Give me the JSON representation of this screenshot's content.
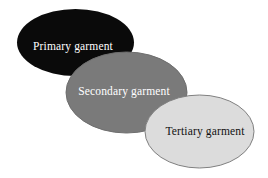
{
  "diagram": {
    "type": "layered-ellipse-cascade",
    "background_color": "#ffffff",
    "stages": [
      {
        "id": "primary",
        "label": "Primary garment",
        "fill": "#0a0a0a",
        "stroke": "none",
        "text_color": "#ffffff",
        "cx": 75.5,
        "cy": 42.5,
        "rx": 58.5,
        "ry": 33.5,
        "label_x": 73,
        "label_y": 47
      },
      {
        "id": "secondary",
        "label": "Secondary garment",
        "fill": "#7a7a7a",
        "stroke": "#6e6e6e",
        "text_color": "#ffffff",
        "cx": 126.5,
        "cy": 92.5,
        "rx": 60.5,
        "ry": 40.5,
        "label_x": 124,
        "label_y": 92
      },
      {
        "id": "tertiary",
        "label": "Tertiary garment",
        "fill": "#dcdcdc",
        "stroke": "#808080",
        "text_color": "#111111",
        "cx": 199.5,
        "cy": 131.5,
        "rx": 54.5,
        "ry": 36.5,
        "label_x": 205,
        "label_y": 132
      }
    ],
    "arrows": [
      {
        "id": "primary-to-secondary",
        "from": "primary",
        "to": "secondary",
        "color": "#111111",
        "x1": 84,
        "y1": 60,
        "x2": 118,
        "y2": 79,
        "style": "dotted"
      },
      {
        "id": "secondary-to-tertiary",
        "from": "secondary",
        "to": "tertiary",
        "color": "#b4b4b4",
        "x1": 159,
        "y1": 108,
        "x2": 192,
        "y2": 119,
        "style": "dotted"
      }
    ]
  }
}
